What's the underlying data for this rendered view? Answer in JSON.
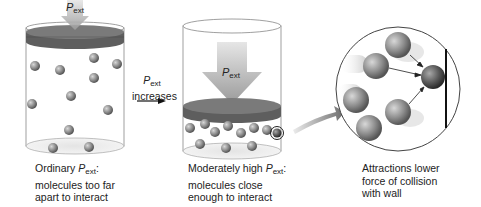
{
  "symbols": {
    "P": "P",
    "ext": "ext"
  },
  "panels": [
    {
      "id": "ordinary",
      "arrow_label_main": "P",
      "arrow_label_sub": "ext",
      "caption": {
        "line1_prefix": "Ordinary ",
        "line1_symbol": "P",
        "line1_sub": "ext",
        "line1_suffix": ":",
        "line2": "molecules too far",
        "line3": "apart to interact"
      }
    },
    {
      "id": "moderately-high",
      "arrow_label_main": "P",
      "arrow_label_sub": "ext",
      "caption": {
        "line1_prefix": "Moderately high ",
        "line1_symbol": "P",
        "line1_sub": "ext",
        "line1_suffix": ":",
        "line2": "molecules close",
        "line3": "enough to interact"
      }
    },
    {
      "id": "magnified",
      "caption": {
        "line1": "Attractions lower",
        "line2": "force of collision",
        "line3": "with wall"
      }
    }
  ],
  "transition": {
    "symbol": "P",
    "sub": "ext",
    "text": "increases"
  },
  "colors": {
    "piston_top": "#7a7a7a",
    "piston_side": "#5e5e5e",
    "molecule": "#8c8c8c",
    "arrow": "#b5b5b5",
    "outline": "#555555",
    "wall": "#111111"
  }
}
